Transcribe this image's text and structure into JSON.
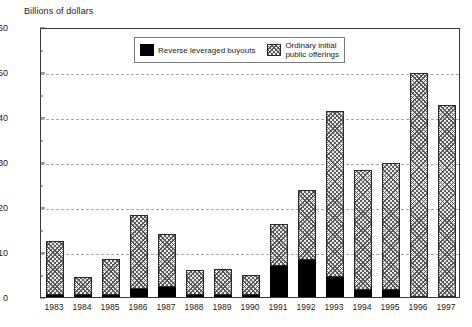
{
  "chart_data": {
    "type": "bar",
    "stacked": true,
    "title": "",
    "ylabel": "Billions of dollars",
    "xlabel": "",
    "ylim": [
      0,
      60
    ],
    "yticks": [
      0,
      10,
      20,
      30,
      40,
      50,
      60
    ],
    "yminorticks": [
      5,
      15,
      25,
      35,
      45,
      55
    ],
    "grid": "horizontal-dashed",
    "legend_position": "upper-center",
    "categories": [
      "1983",
      "1984",
      "1985",
      "1986",
      "1987",
      "1988",
      "1989",
      "1990",
      "1991",
      "1992",
      "1993",
      "1994",
      "1995",
      "1996",
      "1997"
    ],
    "series": [
      {
        "name": "Reverse leveraged buyouts",
        "color": "#000000",
        "pattern": "solid",
        "values": [
          0.5,
          0.1,
          0.4,
          1.7,
          2.3,
          0.3,
          0.3,
          0.2,
          6.8,
          8.2,
          4.4,
          1.6,
          1.5,
          0.0,
          0.0
        ]
      },
      {
        "name": "Ordinary initial public offerings",
        "color": "#e9e9e9",
        "pattern": "hatch",
        "values": [
          12.0,
          4.1,
          8.0,
          16.5,
          11.8,
          5.5,
          5.8,
          4.4,
          9.5,
          15.6,
          36.9,
          26.7,
          28.2,
          49.8,
          42.7
        ]
      }
    ],
    "totals": [
      12.5,
      4.2,
      8.4,
      18.2,
      14.1,
      5.8,
      6.1,
      4.6,
      16.3,
      23.8,
      41.3,
      28.3,
      29.7,
      49.8,
      42.7
    ]
  },
  "legend": {
    "items": [
      {
        "label": "Reverse leveraged buyouts",
        "swatch": "black"
      },
      {
        "label": "Ordinary initial\npublic offerings",
        "swatch": "hatch"
      }
    ]
  },
  "caption": ""
}
